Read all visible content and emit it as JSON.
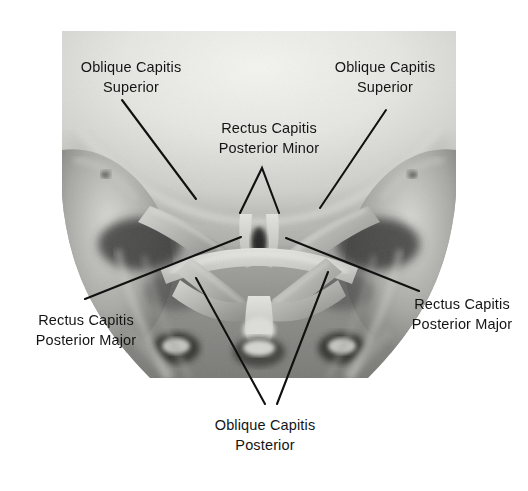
{
  "figure": {
    "kind": "anatomical-photograph",
    "rendering": "grayscale photograph / dissection plate",
    "background_color": "#ffffff",
    "text_color": "#141414",
    "leader_line_color": "#111111",
    "photo_bounds": {
      "x": 62,
      "y": 31,
      "width": 394,
      "height": 347
    }
  },
  "labels": [
    {
      "id": "oblique-capitis-superior-left",
      "line1": "Oblique Capitis",
      "line2": "Superior",
      "text": "Oblique Capitis\nSuperior",
      "x": 64,
      "y": 57,
      "width": 134,
      "align": "center"
    },
    {
      "id": "oblique-capitis-superior-right",
      "line1": "Oblique Capitis",
      "line2": "Superior",
      "text": "Oblique Capitis\nSuperior",
      "x": 318,
      "y": 57,
      "width": 134,
      "align": "center"
    },
    {
      "id": "rectus-capitis-posterior-minor",
      "line1": "Rectus Capitis",
      "line2": "Posterior Minor",
      "text": "Rectus Capitis\nPosterior Minor",
      "x": 206,
      "y": 118,
      "width": 126,
      "align": "center"
    },
    {
      "id": "rectus-capitis-posterior-major-left",
      "line1": "Rectus Capitis",
      "line2": "Posterior Major",
      "text": "Rectus Capitis\nPosterior Major",
      "x": 20,
      "y": 310,
      "width": 132,
      "align": "center"
    },
    {
      "id": "rectus-capitis-posterior-major-right",
      "line1": "Rectus Capitis",
      "line2": "Posterior Major",
      "text": "Rectus Capitis\nPosterior Major",
      "x": 396,
      "y": 294,
      "width": 132,
      "align": "center"
    },
    {
      "id": "oblique-capitis-posterior",
      "line1": "Oblique Capitis",
      "line2": "Posterior",
      "text": "Oblique Capitis\nPosterior",
      "x": 198,
      "y": 415,
      "width": 134,
      "align": "center"
    }
  ],
  "leader_lines": [
    {
      "id": "leader-ocs-left",
      "points": "122,100 196,199"
    },
    {
      "id": "leader-ocs-right",
      "points": "386,110 320,208"
    },
    {
      "id": "leader-rcpmin-left-leg",
      "points": "262,168 240,213"
    },
    {
      "id": "leader-rcpmin-right-leg",
      "points": "262,168 279,213"
    },
    {
      "id": "leader-rcpmaj-left",
      "points": "85,299 241,237"
    },
    {
      "id": "leader-rcpmaj-right",
      "points": "286,238 419,291"
    },
    {
      "id": "leader-ocp-left-leg",
      "points": "196,278 265,404"
    },
    {
      "id": "leader-ocp-right-leg",
      "points": "328,272 277,404"
    }
  ],
  "anatomy_regions": [
    {
      "id": "occipital-bone",
      "label": "occipital bone / skull base"
    },
    {
      "id": "mastoid-left",
      "label": "left mastoid process"
    },
    {
      "id": "mastoid-right",
      "label": "right mastoid process"
    },
    {
      "id": "atlas-c1",
      "label": "atlas (C1) posterior arch"
    },
    {
      "id": "axis-c2",
      "label": "axis (C2) spinous process"
    },
    {
      "id": "cervical-spine",
      "label": "cervical vertebrae"
    }
  ],
  "colors": {
    "photo_light": "#e9e9e6",
    "photo_mid": "#9a9a97",
    "photo_dark": "#3a3a38",
    "photo_shadow": "#1c1c1b",
    "text": "#141414",
    "leader": "#111111",
    "page": "#ffffff"
  }
}
